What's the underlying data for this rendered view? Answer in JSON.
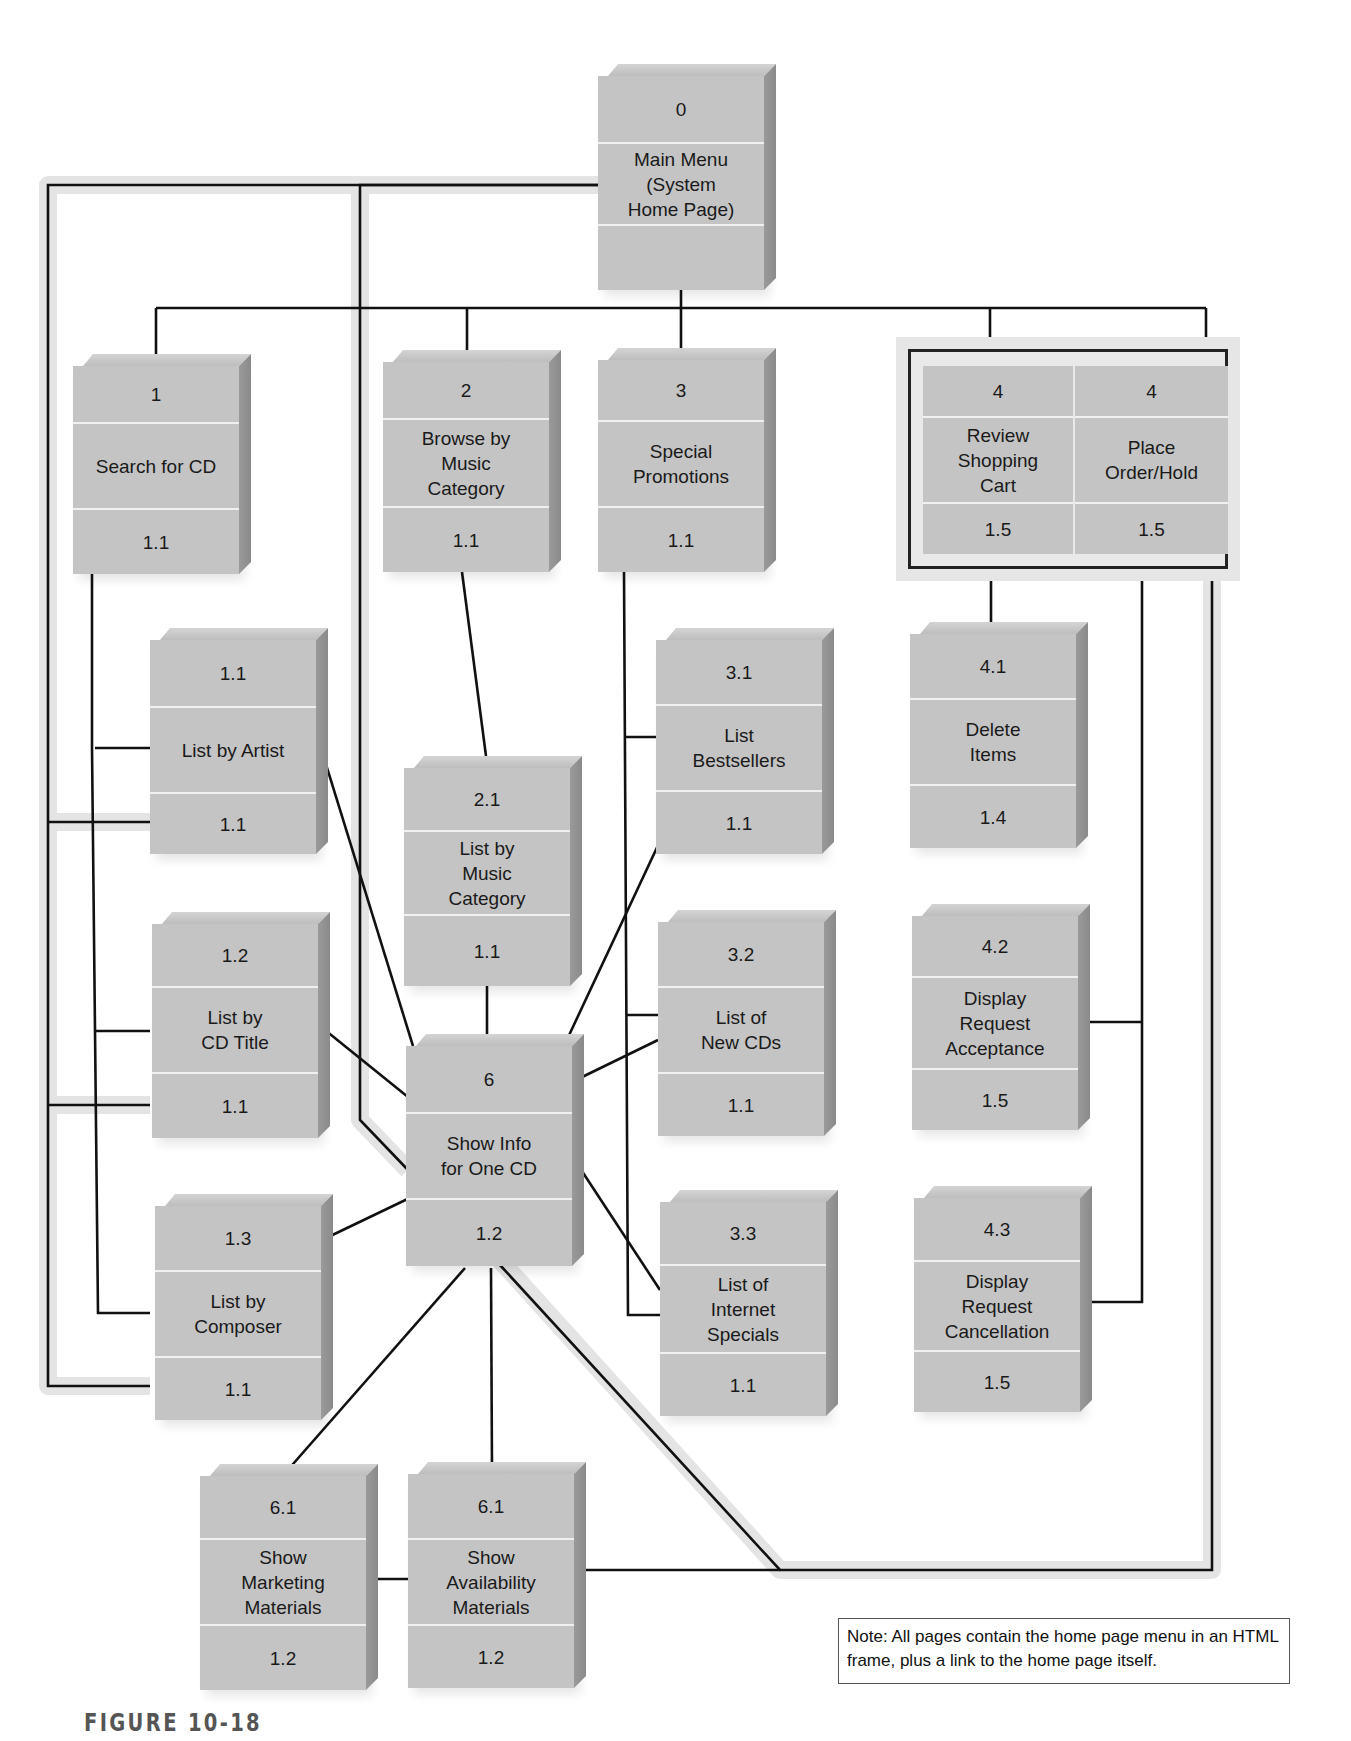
{
  "diagram": {
    "type": "web-site navigation hierarchy",
    "colors": {
      "box_face": "#c4c4c4",
      "box_side": "#8f8f8f",
      "line": "#111111",
      "return_path": "#e4e4e4"
    },
    "pages": [
      {
        "id": "p0",
        "number": "0",
        "title": "Main Menu\n(System\nHome Page)",
        "ref": ""
      },
      {
        "id": "p1",
        "number": "1",
        "title": "Search for CD",
        "ref": "1.1"
      },
      {
        "id": "p2",
        "number": "2",
        "title": "Browse by\nMusic\nCategory",
        "ref": "1.1"
      },
      {
        "id": "p3",
        "number": "3",
        "title": "Special\nPromotions",
        "ref": "1.1"
      },
      {
        "id": "p4a",
        "number": "4",
        "title": "Review\nShopping\nCart",
        "ref": "1.5"
      },
      {
        "id": "p4b",
        "number": "4",
        "title": "Place\nOrder/Hold",
        "ref": "1.5"
      },
      {
        "id": "p11",
        "number": "1.1",
        "title": "List by Artist",
        "ref": "1.1"
      },
      {
        "id": "p12",
        "number": "1.2",
        "title": "List by\nCD Title",
        "ref": "1.1"
      },
      {
        "id": "p13",
        "number": "1.3",
        "title": "List by\nComposer",
        "ref": "1.1"
      },
      {
        "id": "p21",
        "number": "2.1",
        "title": "List by\nMusic\nCategory",
        "ref": "1.1"
      },
      {
        "id": "p31",
        "number": "3.1",
        "title": "List\nBestsellers",
        "ref": "1.1"
      },
      {
        "id": "p32",
        "number": "3.2",
        "title": "List of\nNew CDs",
        "ref": "1.1"
      },
      {
        "id": "p33",
        "number": "3.3",
        "title": "List of\nInternet\nSpecials",
        "ref": "1.1"
      },
      {
        "id": "p41",
        "number": "4.1",
        "title": "Delete\nItems",
        "ref": "1.4"
      },
      {
        "id": "p42",
        "number": "4.2",
        "title": "Display\nRequest\nAcceptance",
        "ref": "1.5"
      },
      {
        "id": "p43",
        "number": "4.3",
        "title": "Display\nRequest\nCancellation",
        "ref": "1.5"
      },
      {
        "id": "p6",
        "number": "6",
        "title": "Show Info\nfor One CD",
        "ref": "1.2"
      },
      {
        "id": "p61a",
        "number": "6.1",
        "title": "Show\nMarketing\nMaterials",
        "ref": "1.2"
      },
      {
        "id": "p61b",
        "number": "6.1",
        "title": "Show\nAvailability\nMaterials",
        "ref": "1.2"
      }
    ]
  },
  "note": "Note: All pages contain the home page menu in an HTML frame, plus a link to the home page itself.",
  "figure_label": "FIGURE 10-18"
}
